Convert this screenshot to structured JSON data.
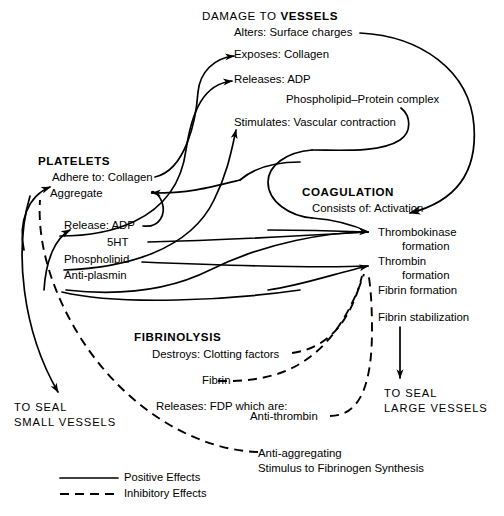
{
  "diagram": {
    "background_color": "#ffffff",
    "ink_color": "#000000",
    "sections": {
      "damage": {
        "heading_prefix": "DAMAGE TO ",
        "heading_emphasis": "VESSELS",
        "items": [
          "Alters: Surface charges",
          "Exposes: Collagen",
          "Releases: ADP",
          "Phospholipid–Protein complex",
          "Stimulates: Vascular contraction"
        ]
      },
      "platelets": {
        "heading": "PLATELETS",
        "items": [
          "Adhere to: Collagen",
          "Aggregate",
          "Release: ADP",
          "5HT",
          "Phospholipid",
          "Anti-plasmin"
        ]
      },
      "coagulation": {
        "heading": "COAGULATION",
        "items": [
          "Consists of: Activation",
          "Thrombokinase",
          "formation",
          "Thrombin",
          "formation",
          "Fibrin formation",
          "Fibrin stabilization"
        ]
      },
      "fibrinolysis": {
        "heading": "FIBRINOLYSIS",
        "items": [
          "Destroys: Clotting factors",
          "Fibrin",
          "Releases: FDP which are:",
          "Anti-thrombin",
          "Anti-aggregating",
          "Stimulus to Fibrinogen Synthesis"
        ]
      }
    },
    "outcomes": {
      "small": {
        "line1": "TO SEAL",
        "line2": "SMALL VESSELS"
      },
      "large": {
        "line1": "TO SEAL",
        "line2": "LARGE VESSELS"
      }
    },
    "legend": {
      "positive": "Positive Effects",
      "inhibitory": "Inhibitory Effects"
    }
  }
}
